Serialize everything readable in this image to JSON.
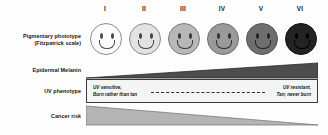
{
  "figure": {
    "background_color": "#fdfdfd",
    "width": 328,
    "height": 135
  },
  "rows": {
    "phototype_label_line1": "Pigmentary phototype",
    "phototype_label_line2": "(Fitzpatrick scale)",
    "melanin_label": "Epidermal Melanin",
    "uv_label": "UV phenotype",
    "cancer_label": "Cancer risk"
  },
  "phototypes": [
    {
      "numeral": "I",
      "skin_color": "#fbfbfb",
      "outline_color": "#8d8d8d",
      "feature_color": "#4a4a4a"
    },
    {
      "numeral": "II",
      "skin_color": "#e2e2e2",
      "outline_color": "#8a8a8a",
      "feature_color": "#454545"
    },
    {
      "numeral": "III",
      "skin_color": "#b8b8b8",
      "outline_color": "#7d7d7d",
      "feature_color": "#3a3a3a"
    },
    {
      "numeral": "IV",
      "skin_color": "#9a9a9a",
      "outline_color": "#6f6f6f",
      "feature_color": "#303030"
    },
    {
      "numeral": "V",
      "skin_color": "#6e6e6e",
      "outline_color": "#565656",
      "feature_color": "#242424"
    },
    {
      "numeral": "VI",
      "skin_color": "#232323",
      "outline_color": "#111111",
      "feature_color": "#000000"
    }
  ],
  "melanin_wedge": {
    "direction": "increases-left-to-right",
    "fill_color": "#4d4d4d",
    "stroke_color": "#2a2a2a"
  },
  "cancer_wedge": {
    "direction": "decreases-left-to-right",
    "fill_color": "#b4b4b4",
    "stroke_color": "#7b7b7b"
  },
  "uv_phenotype": {
    "left_line1": "UV sensitive,",
    "left_line2": "Burn rather than tan",
    "right_line1": "UV resistant,",
    "right_line2": "Tan; never burn",
    "border_color": "#3a3a3a",
    "background_color": "#f4f4f4"
  }
}
